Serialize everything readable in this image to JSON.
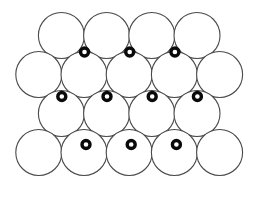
{
  "figure": {
    "name": "close-packed-spheres-with-interstitial-sites",
    "width": 279,
    "height": 206,
    "background_color": "#ffffff"
  },
  "style": {
    "sphere_fill": "#ffffff",
    "sphere_stroke": "#4a4a4a",
    "sphere_stroke_width": 1.1,
    "ring_fill": "#ffffff",
    "ring_stroke": "#0a0a0a",
    "ring_stroke_width": 3.4
  },
  "geometry": {
    "sphere_radius": 23.0,
    "ring_outer_radius": 4.0,
    "row_spacing": 39.0,
    "column_spacing": 45.2
  },
  "spheres": {
    "label": "large-circle",
    "count": 18,
    "rows": [
      {
        "row_index": 1,
        "row_name": "top-row",
        "cy": 35.5,
        "r": 23.0,
        "cx_values": [
          61.4,
          106.6,
          151.8,
          197.0
        ]
      },
      {
        "row_index": 2,
        "row_name": "second-row",
        "cy": 74.5,
        "r": 23.0,
        "cx_values": [
          38.8,
          84.0,
          129.2,
          174.4,
          219.6
        ]
      },
      {
        "row_index": 3,
        "row_name": "third-row",
        "cy": 113.5,
        "r": 23.0,
        "cx_values": [
          61.4,
          106.6,
          151.8,
          197.0
        ]
      },
      {
        "row_index": 4,
        "row_name": "bottom-row",
        "cy": 152.5,
        "r": 23.0,
        "cx_values": [
          38.8,
          84.0,
          129.2,
          174.4,
          219.6
        ]
      }
    ]
  },
  "interstitials": {
    "label": "interstitial-site-ring",
    "count": 10,
    "outer_radius": 4.0,
    "rows": [
      {
        "row_index": 1,
        "row_name": "upper-interstitial-row",
        "cy": 52.0,
        "cx_values": [
          84.5,
          129.7,
          174.9
        ]
      },
      {
        "row_index": 2,
        "row_name": "middle-interstitial-row",
        "cy": 96.5,
        "cx_values": [
          61.8,
          107.0,
          152.2,
          197.4
        ]
      },
      {
        "row_index": 3,
        "row_name": "lower-interstitial-row",
        "cy": 144.5,
        "cx_values": [
          86.0,
          131.2,
          176.4
        ]
      }
    ]
  }
}
